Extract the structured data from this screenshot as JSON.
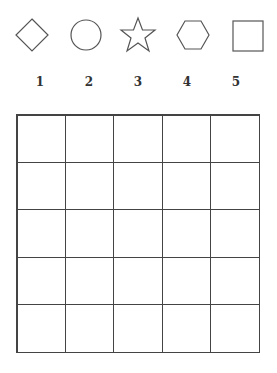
{
  "shapes": [
    {
      "name": "diamond",
      "label": "1"
    },
    {
      "name": "circle",
      "label": "2"
    },
    {
      "name": "star",
      "label": "3"
    },
    {
      "name": "hexagon",
      "label": "4"
    },
    {
      "name": "square",
      "label": "5"
    }
  ],
  "grid": {
    "rows": 5,
    "cols": 5
  },
  "stroke_color": "#444444"
}
